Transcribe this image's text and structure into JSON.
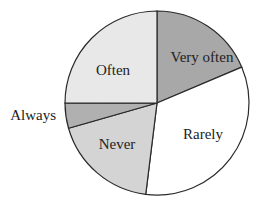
{
  "chart_data": {
    "type": "pie",
    "title": "",
    "start_angle_deg": 0,
    "direction": "clockwise",
    "categories": [
      "Very often",
      "Rarely",
      "Never",
      "Always",
      "Often"
    ],
    "values": [
      18.6,
      33.3,
      18.6,
      4.4,
      25.0
    ],
    "unit": "percent (estimated from slice angles)",
    "colors": [
      "#a8a8a8",
      "#ffffff",
      "#d4d4d4",
      "#b0b0b0",
      "#e8e8e8"
    ],
    "labels": [
      {
        "text": "Very often",
        "x": 202,
        "y": 62,
        "anchor": "middle"
      },
      {
        "text": "Rarely",
        "x": 203,
        "y": 139,
        "anchor": "middle"
      },
      {
        "text": "Never",
        "x": 117,
        "y": 149,
        "anchor": "middle"
      },
      {
        "text": "Always",
        "x": 56,
        "y": 120,
        "anchor": "end"
      },
      {
        "text": "Often",
        "x": 113,
        "y": 75,
        "anchor": "middle"
      }
    ],
    "legend": "none",
    "center": [
      157,
      103
    ],
    "radius": 92
  }
}
